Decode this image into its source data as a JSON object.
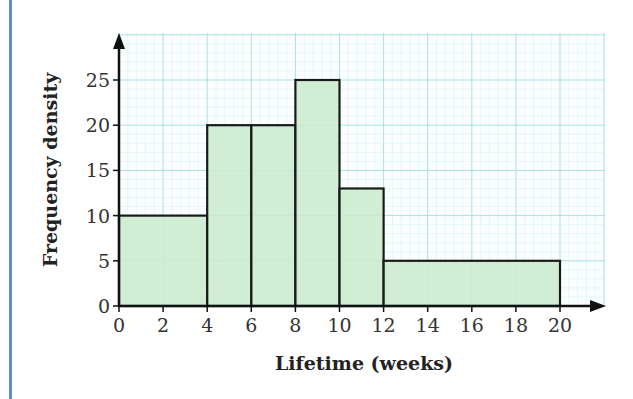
{
  "chart_data": {
    "type": "histogram",
    "title": "",
    "xlabel": "Lifetime (weeks)",
    "ylabel": "Frequency density",
    "bins": [
      {
        "from": 0,
        "to": 4,
        "density": 10
      },
      {
        "from": 4,
        "to": 6,
        "density": 20
      },
      {
        "from": 6,
        "to": 8,
        "density": 20
      },
      {
        "from": 8,
        "to": 10,
        "density": 25
      },
      {
        "from": 10,
        "to": 12,
        "density": 13
      },
      {
        "from": 12,
        "to": 20,
        "density": 5
      }
    ],
    "categories": [
      "0-4",
      "4-6",
      "6-8",
      "8-10",
      "10-12",
      "12-20"
    ],
    "values": [
      10,
      20,
      20,
      25,
      13,
      5
    ],
    "x_ticks": [
      "0",
      "2",
      "4",
      "6",
      "8",
      "10",
      "12",
      "14",
      "16",
      "18",
      "20"
    ],
    "y_ticks": [
      "0",
      "5",
      "10",
      "15",
      "20",
      "25"
    ],
    "xlim": [
      0,
      22
    ],
    "ylim": [
      0,
      25
    ],
    "grid": true,
    "legend": null
  },
  "colors": {
    "bar_fill": "#c9ebcd",
    "bar_stroke": "#1a1a1a",
    "grid_major": "#a8dfe6",
    "grid_minor": "#d6f0f3",
    "frame_accent": "#5b8fc9"
  }
}
